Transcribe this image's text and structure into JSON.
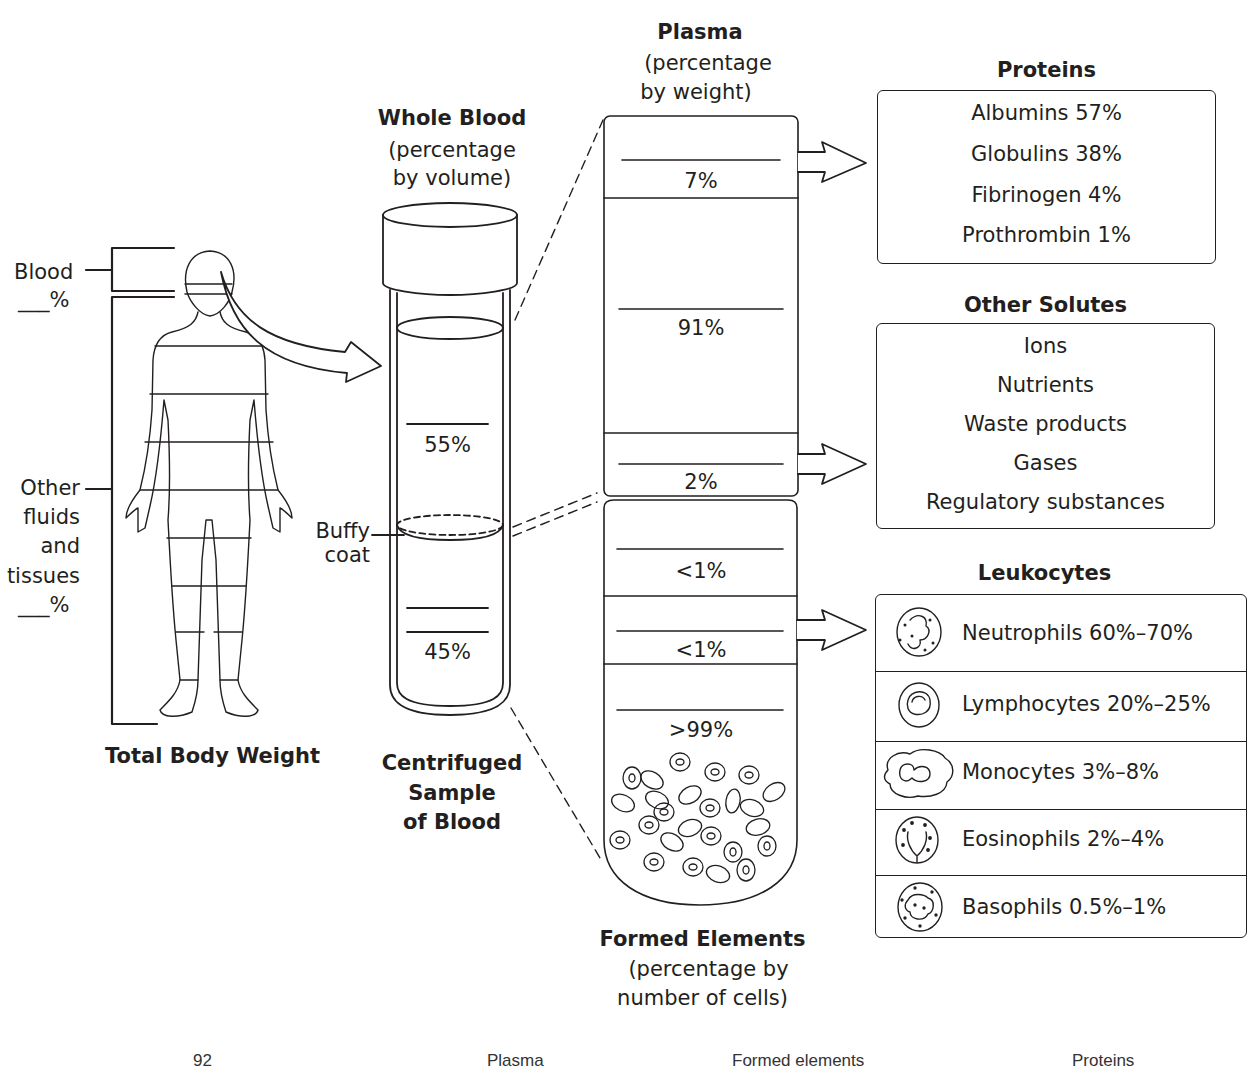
{
  "top_cut_text": "",
  "body": {
    "blood_label": "Blood",
    "blood_blank": "___%",
    "other_label_lines": [
      "Other",
      "fluids",
      "and",
      "tissues",
      "___%"
    ],
    "title": "Total Body Weight"
  },
  "whole_blood": {
    "title": "Whole Blood",
    "subtitle_lines": [
      "(percentage",
      "by volume)"
    ],
    "plasma_pct": "55%",
    "buffy_label_lines": [
      "Buffy",
      "coat"
    ],
    "formed_pct": "45%",
    "caption_lines": [
      "Centrifuged",
      "Sample",
      "of Blood"
    ]
  },
  "plasma": {
    "title": "Plasma",
    "subtitle_lines": [
      "(percentage",
      "by weight)"
    ],
    "rows": [
      {
        "name": "proteins",
        "value": "7%"
      },
      {
        "name": "water",
        "value": "91%"
      },
      {
        "name": "other-solutes",
        "value": "2%"
      }
    ]
  },
  "formed": {
    "rows": [
      {
        "name": "platelets",
        "value": "<1%"
      },
      {
        "name": "leukocytes",
        "value": "<1%"
      },
      {
        "name": "erythrocytes",
        "value": ">99%"
      }
    ],
    "title": "Formed Elements",
    "subtitle_lines": [
      "(percentage by",
      "number of cells)"
    ]
  },
  "proteins": {
    "title": "Proteins",
    "items": [
      {
        "label": "Albumins  57%"
      },
      {
        "label": "Globulins  38%"
      },
      {
        "label": "Fibrinogen  4%"
      },
      {
        "label": "Prothrombin  1%"
      }
    ]
  },
  "other_solutes": {
    "title": "Other Solutes",
    "items": [
      {
        "label": "Ions"
      },
      {
        "label": "Nutrients"
      },
      {
        "label": "Waste products"
      },
      {
        "label": "Gases"
      },
      {
        "label": "Regulatory substances"
      }
    ]
  },
  "leukocytes": {
    "title": "Leukocytes",
    "items": [
      {
        "label": "Neutrophils  60%–70%",
        "icon": "neutrophil-icon"
      },
      {
        "label": "Lymphocytes  20%–25%",
        "icon": "lymphocyte-icon"
      },
      {
        "label": "Monocytes  3%–8%",
        "icon": "monocyte-icon"
      },
      {
        "label": "Eosinophils  2%–4%",
        "icon": "eosinophil-icon"
      },
      {
        "label": "Basophils  0.5%–1%",
        "icon": "basophil-icon"
      }
    ]
  },
  "footer": {
    "items": [
      "92",
      "Plasma",
      "Formed elements",
      "Proteins"
    ]
  },
  "colors": {
    "ink": "#231f20",
    "background": "#ffffff",
    "footer_text": "#333333"
  }
}
